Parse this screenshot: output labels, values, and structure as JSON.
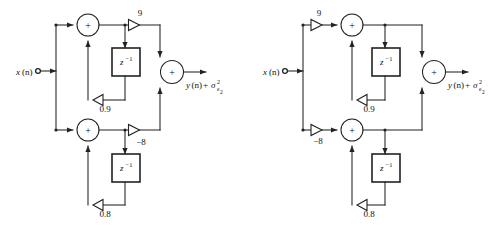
{
  "figure": {
    "type": "signal-flow-diagram",
    "background_color": "#ffffff",
    "line_color": "#222222",
    "diagram_count": 2
  },
  "diagrams": [
    {
      "id": "left",
      "name": "gains-after-summers",
      "input": {
        "label_x": "x",
        "label_n": "(n)",
        "terminal": "open-circle"
      },
      "output": {
        "label_y": "y",
        "label_n": "(n)",
        "plus": "+",
        "sigma": "σ",
        "sigma_sup": "2",
        "sigma_sub": "e",
        "sigma_sub2": "2"
      },
      "sections": [
        {
          "name": "upper-section",
          "adder_symbol": "+",
          "delay_label": "z",
          "delay_sup": "−1",
          "forward_gain": "9",
          "feedback_gain": "0.9",
          "gain_position": "after-summer"
        },
        {
          "name": "lower-section",
          "adder_symbol": "+",
          "delay_label": "z",
          "delay_sup": "−1",
          "forward_gain": "−8",
          "feedback_gain": "0.8",
          "gain_position": "after-summer"
        }
      ],
      "output_adder_symbol": "+"
    },
    {
      "id": "right",
      "name": "gains-before-summers",
      "input": {
        "label_x": "x",
        "label_n": "(n)",
        "terminal": "open-circle"
      },
      "output": {
        "label_y": "y",
        "label_n": "(n)",
        "plus": "+",
        "sigma": "σ",
        "sigma_sup": "2",
        "sigma_sub": "e",
        "sigma_sub2": "2"
      },
      "sections": [
        {
          "name": "upper-section",
          "adder_symbol": "+",
          "delay_label": "z",
          "delay_sup": "−1",
          "forward_gain": "9",
          "feedback_gain": "0.9",
          "gain_position": "before-summer"
        },
        {
          "name": "lower-section",
          "adder_symbol": "+",
          "delay_label": "z",
          "delay_sup": "−1",
          "forward_gain": "−8",
          "feedback_gain": "0.8",
          "gain_position": "before-summer"
        }
      ],
      "output_adder_symbol": "+"
    }
  ]
}
